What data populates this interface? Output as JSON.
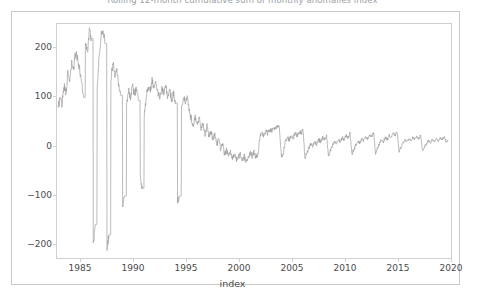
{
  "figure": {
    "title": "Rolling 12-month cumulative sum of monthly anomalies index",
    "title_clipped": true
  },
  "chart_data": {
    "type": "line",
    "title": "Rolling 12-month cumulative sum of monthly anomalies index",
    "xlabel": "index",
    "ylabel": "",
    "xlim": [
      1981.6,
      2021.8
    ],
    "ylim": [
      -215,
      238
    ],
    "grid": false,
    "legend": null,
    "line_color": "#9d9d9d",
    "line_width": 0.7,
    "xticks": [
      1985,
      1990,
      1995,
      2000,
      2005,
      2010,
      2015,
      2020
    ],
    "xticklabels": [
      "1985",
      "1990",
      "1995",
      "2000",
      "2005",
      "2010",
      "2015",
      "2020"
    ],
    "yticks": [
      -200,
      -100,
      0,
      100,
      200
    ],
    "yticklabels": [
      "−200",
      "−100",
      "0",
      "100",
      "200"
    ],
    "x": [
      1981.7,
      1981.9,
      1982.1,
      1982.3,
      1982.5,
      1982.7,
      1982.9,
      1983.1,
      1983.3,
      1983.5,
      1983.7,
      1983.9,
      1984.1,
      1984.3,
      1984.5,
      1984.7,
      1984.9,
      1985.1,
      1985.3,
      1985.5,
      1985.7,
      1985.9,
      1986.1,
      1986.3,
      1986.5,
      1986.7,
      1986.9,
      1987.1,
      1987.3,
      1987.5,
      1987.7,
      1987.9,
      1988.1,
      1988.3,
      1988.5,
      1988.7,
      1988.9,
      1989.1,
      1989.3,
      1989.5,
      1989.7,
      1989.9,
      1990.1,
      1990.3,
      1990.5,
      1990.7,
      1990.9,
      1991.1,
      1991.3,
      1991.5,
      1991.7,
      1991.9,
      1992.1,
      1992.3,
      1992.5,
      1992.7,
      1992.9,
      1993.1,
      1993.3,
      1993.5,
      1993.7,
      1993.9,
      1994.1,
      1994.3,
      1994.5,
      1994.7,
      1994.9,
      1995.1,
      1995.3,
      1995.5,
      1995.7,
      1995.9,
      1996.1,
      1996.3,
      1996.5,
      1996.7,
      1996.9,
      1997.1,
      1997.3,
      1997.5,
      1997.7,
      1997.9,
      1998.1,
      1998.3,
      1998.5,
      1998.7,
      1998.9,
      1999.1,
      1999.3,
      1999.5,
      1999.7,
      1999.9,
      2000.1,
      2000.3,
      2000.5,
      2000.7,
      2000.9,
      2001.1,
      2001.3,
      2001.5,
      2001.7,
      2001.9,
      2002.1,
      2002.3,
      2002.5,
      2002.7,
      2002.9,
      2003.1,
      2003.3,
      2003.5,
      2003.7,
      2003.9,
      2004.1,
      2004.3,
      2004.5,
      2004.7,
      2004.9,
      2005.1,
      2005.3,
      2005.5,
      2005.7,
      2005.9,
      2006.1,
      2006.3,
      2006.5,
      2006.7,
      2006.9,
      2007.1,
      2007.3,
      2007.5,
      2007.7,
      2007.9,
      2008.1,
      2008.3,
      2008.5,
      2008.7,
      2008.9,
      2009.1,
      2009.3,
      2009.5,
      2009.7,
      2009.9,
      2010.1,
      2010.3,
      2010.5,
      2010.7,
      2010.9,
      2011.1,
      2011.3,
      2011.5,
      2011.7,
      2011.9,
      2012.1,
      2012.3,
      2012.5,
      2012.7,
      2012.9,
      2013.1,
      2013.3,
      2013.5,
      2013.7,
      2013.9,
      2014.1,
      2014.3,
      2014.5,
      2014.7,
      2014.9,
      2015.1,
      2015.3,
      2015.5,
      2015.7,
      2015.9,
      2016.1,
      2016.3,
      2016.5,
      2016.7,
      2016.9,
      2017.1,
      2017.3,
      2017.5,
      2017.7,
      2017.9,
      2018.1,
      2018.3,
      2018.5,
      2018.7,
      2018.9,
      2019.1,
      2019.3,
      2019.5,
      2019.7,
      2019.9,
      2020.1,
      2020.3,
      2020.5,
      2020.7,
      2020.9,
      2021.1,
      2021.3,
      2021.5
    ],
    "y": [
      72,
      96,
      84,
      118,
      106,
      140,
      128,
      160,
      150,
      185,
      172,
      150,
      130,
      96,
      205,
      182,
      225,
      210,
      -190,
      -150,
      120,
      175,
      215,
      228,
      200,
      -195,
      -170,
      130,
      165,
      140,
      155,
      120,
      100,
      -115,
      -95,
      85,
      110,
      95,
      120,
      100,
      115,
      90,
      -60,
      -80,
      60,
      95,
      120,
      105,
      130,
      110,
      125,
      105,
      95,
      115,
      100,
      120,
      95,
      110,
      90,
      105,
      85,
      -105,
      -95,
      70,
      100,
      85,
      95,
      70,
      55,
      40,
      60,
      45,
      55,
      35,
      45,
      25,
      40,
      20,
      30,
      15,
      25,
      5,
      15,
      -5,
      5,
      -15,
      -5,
      -20,
      -10,
      -22,
      -12,
      -25,
      -20,
      -15,
      -25,
      -18,
      -28,
      -20,
      -12,
      -18,
      -10,
      -20,
      -14,
      18,
      26,
      22,
      30,
      26,
      34,
      30,
      38,
      34,
      40,
      36,
      -20,
      -10,
      10,
      18,
      14,
      22,
      18,
      26,
      22,
      30,
      26,
      34,
      -22,
      -12,
      -2,
      6,
      2,
      10,
      6,
      14,
      10,
      18,
      14,
      22,
      -18,
      -8,
      2,
      10,
      6,
      14,
      10,
      18,
      14,
      22,
      18,
      26,
      -14,
      -4,
      4,
      12,
      8,
      16,
      12,
      20,
      16,
      24,
      20,
      28,
      -12,
      -2,
      6,
      14,
      10,
      18,
      14,
      22,
      18,
      26,
      22,
      30,
      -10,
      0,
      8,
      14,
      10,
      16,
      12,
      18,
      14,
      20,
      16,
      22,
      -8,
      0,
      6,
      12,
      8,
      14,
      10,
      16,
      12,
      18,
      14,
      20,
      10,
      12,
      8,
      14
    ]
  },
  "axes": {
    "xlabel": "index",
    "xticklabels": [
      "1985",
      "1990",
      "1995",
      "2000",
      "2005",
      "2010",
      "2015",
      "2020"
    ],
    "yticklabels": [
      "200",
      "100",
      "0",
      "−100",
      "−200"
    ]
  }
}
